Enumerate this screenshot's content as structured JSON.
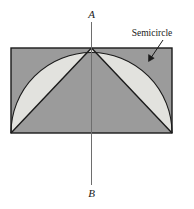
{
  "figure": {
    "name": "semicircle-in-rectangle-diagram",
    "background_color": "#ffffff",
    "labels": {
      "top_axis_label": "A",
      "bottom_axis_label": "B",
      "callout_label": "Semicircle"
    },
    "colors": {
      "rectangle_fill": "#9b9b9b",
      "lune_fill": "#e2e2de",
      "stroke": "#1a1a1a",
      "axis_line": "#6e6e6e",
      "text": "#1a1a1a"
    },
    "geometry": {
      "rectangle": {
        "x": 11,
        "y": 48,
        "width": 161,
        "height": 85
      },
      "semicircle": {
        "center_x": 91.5,
        "center_y": 133,
        "radius": 80.5
      },
      "apex": {
        "x": 91.5,
        "y": 48
      },
      "left_corner": {
        "x": 11,
        "y": 133
      },
      "right_corner": {
        "x": 172,
        "y": 133
      },
      "axis_line": {
        "x": 91.5,
        "y_top": 22,
        "y_bottom": 185
      },
      "callout_leader": {
        "x1": 163,
        "y1": 40,
        "x2": 148.5,
        "y2": 61.5
      }
    },
    "label_positions": {
      "top_axis_label": {
        "x": 91.5,
        "y": 18
      },
      "bottom_axis_label": {
        "x": 91.5,
        "y": 197
      },
      "callout_label": {
        "x": 152,
        "y": 36
      }
    }
  }
}
